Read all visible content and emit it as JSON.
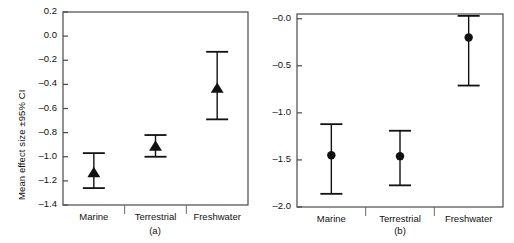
{
  "figure": {
    "background": "#ffffff",
    "ink": "#111111"
  },
  "chart_data": [
    {
      "type": "scatter",
      "id": "panel-a",
      "title": "",
      "caption": "(a)",
      "xlabel": "",
      "ylabel": "Mean effect size ±95% CI",
      "categories": [
        "Marine",
        "Terrestrial",
        "Freshwater"
      ],
      "values": [
        -1.13,
        -0.91,
        -0.43
      ],
      "ci_lower": [
        -1.26,
        -1.0,
        -0.69
      ],
      "ci_upper": [
        -0.97,
        -0.82,
        -0.13
      ],
      "ylim": [
        -1.4,
        0.2
      ],
      "yticks": [
        0.2,
        0.0,
        -0.2,
        -0.4,
        -0.6,
        -0.8,
        -1.0,
        -1.2,
        -1.4
      ],
      "ytick_labels": [
        "0.2",
        "0.0",
        "–0.2",
        "–0.4",
        "–0.6",
        "–0.8",
        "–1.0",
        "–1.2",
        "–1.4"
      ],
      "marker": "triangle",
      "grid": false,
      "legend": "none"
    },
    {
      "type": "scatter",
      "id": "panel-b",
      "title": "",
      "caption": "(b)",
      "xlabel": "",
      "ylabel": "",
      "categories": [
        "Marine",
        "Terrestrial",
        "Freshwater"
      ],
      "values": [
        -1.45,
        -1.46,
        -0.2
      ],
      "ci_lower": [
        -1.86,
        -1.77,
        -0.71
      ],
      "ci_upper": [
        -1.12,
        -1.19,
        0.03
      ],
      "ylim": [
        -2.0,
        0.05
      ],
      "yticks": [
        -0.0,
        -0.5,
        -1.0,
        -1.5,
        -2.0
      ],
      "ytick_labels": [
        "–0.0",
        "–0.5",
        "–1.0",
        "–1.5",
        "–2.0"
      ],
      "marker": "circle",
      "grid": false,
      "legend": "none"
    }
  ]
}
